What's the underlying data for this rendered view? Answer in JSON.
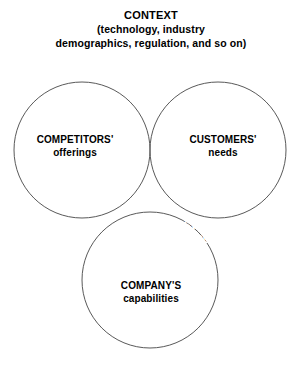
{
  "figure": {
    "name": "sweet-spot-venn-diagram",
    "background_color": "#ffffff"
  },
  "title": {
    "main": "CONTEXT",
    "sub_line_1": "(technology, industry",
    "sub_line_2": "demographics, regulation, and so on)"
  },
  "chart_data": {
    "type": "venn",
    "title": "CONTEXT (technology, industry demographics, regulation, and so on)",
    "sets": [
      {
        "id": "competitors",
        "label_top": "COMPETITORS'",
        "label_bottom": "offerings",
        "cx": 82,
        "cy": 150,
        "r": 68,
        "fill": "none",
        "stroke": "#595959"
      },
      {
        "id": "customers",
        "label_top": "CUSTOMERS'",
        "label_bottom": "needs",
        "cx": 218,
        "cy": 150,
        "r": 68,
        "fill": "none",
        "stroke": "#595959"
      },
      {
        "id": "company",
        "label_top": "COMPANY'S",
        "label_bottom": "capabilities",
        "cx": 150,
        "cy": 280,
        "r": 68,
        "fill": "none",
        "stroke": "#595959"
      }
    ],
    "highlight_region": {
      "id": "sweet-spot",
      "label_line_1": "SWEET",
      "label_line_2": "SPOT",
      "intersection_of": [
        "customers",
        "company"
      ],
      "fill": "#7d7d7d",
      "text_color": "#ffffff"
    },
    "legend": "none",
    "grid": false
  },
  "colors": {
    "stroke": "#595959",
    "highlight_fill": "#7d7d7d",
    "highlight_text": "#ffffff",
    "text": "#000000",
    "background": "#ffffff"
  }
}
